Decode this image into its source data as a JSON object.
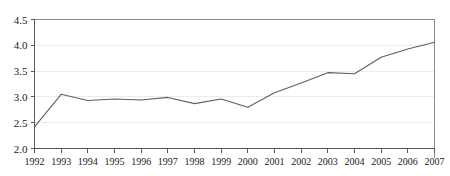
{
  "chart_data": {
    "type": "line",
    "title": "",
    "subtitle": "",
    "xlabel": "",
    "ylabel": "",
    "categories": [
      "1992",
      "1993",
      "1994",
      "1995",
      "1996",
      "1997",
      "1998",
      "1999",
      "2000",
      "2001",
      "2002",
      "2003",
      "2004",
      "2005",
      "2006",
      "2007"
    ],
    "x": [
      1992,
      1993,
      1994,
      1995,
      1996,
      1997,
      1998,
      1999,
      2000,
      2001,
      2002,
      2003,
      2004,
      2005,
      2006,
      2007
    ],
    "values": [
      2.42,
      3.05,
      2.93,
      2.96,
      2.94,
      2.99,
      2.87,
      2.96,
      2.8,
      3.08,
      3.27,
      3.47,
      3.45,
      3.77,
      3.93,
      4.06
    ],
    "series": [
      {
        "name": "",
        "values": [
          2.42,
          3.05,
          2.93,
          2.96,
          2.94,
          2.99,
          2.87,
          2.96,
          2.8,
          3.08,
          3.27,
          3.47,
          3.45,
          3.77,
          3.93,
          4.06
        ]
      }
    ],
    "ylim": [
      2.0,
      4.5
    ],
    "xlim": [
      1992,
      2007
    ],
    "ytick_labels": [
      "2.0",
      "2.5",
      "3.0",
      "3.5",
      "4.0",
      "4.5"
    ],
    "ytick_values": [
      2.0,
      2.5,
      3.0,
      3.5,
      4.0,
      4.5
    ],
    "xtick_labels": [
      "1992",
      "1993",
      "1994",
      "1995",
      "1996",
      "1997",
      "1998",
      "1999",
      "2000",
      "2001",
      "2002",
      "2003",
      "2004",
      "2005",
      "2006",
      "2007"
    ],
    "grid": true,
    "grid_axis": "y",
    "legend": false,
    "legend_position": "none",
    "markers": false,
    "annotations": [],
    "colors": {
      "line": "#5f5f5f",
      "grid": "#ececec",
      "axis": "#5a5a5a",
      "frame": "#8a8a8a",
      "text": "#1a1a1a",
      "background": "#ffffff"
    }
  }
}
